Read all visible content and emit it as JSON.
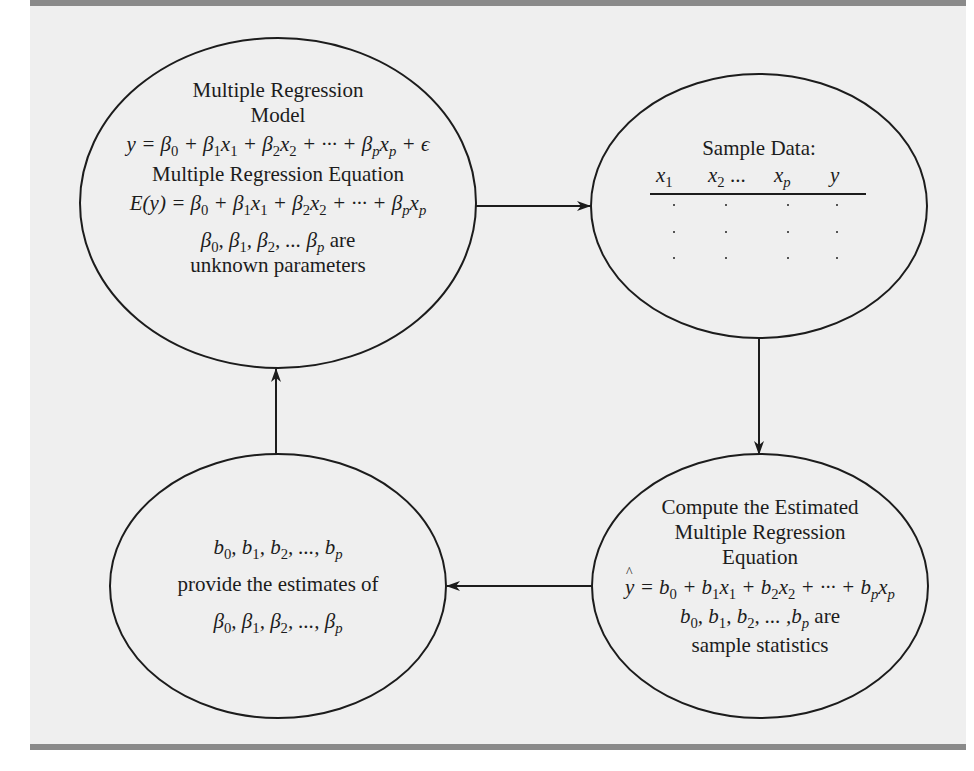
{
  "diagram": {
    "type": "flow-cycle",
    "colors": {
      "background": "#efefef",
      "rule": "#8a8a8a",
      "stroke": "#1c1c1c"
    },
    "nodes": {
      "model": {
        "title_line1": "Multiple Regression",
        "title_line2": "Model",
        "model_equation": "y = β0 + β1x1 + β2x2 + ··· + βpxp + ϵ",
        "subtitle": "Multiple Regression Equation",
        "expected_equation": "E(y) = β0 + β1x1 + β2x2 + ··· + βpxp",
        "params": "β0, β1, β2, ... βp are",
        "params_desc": "unknown parameters"
      },
      "sample": {
        "title": "Sample Data:",
        "columns": [
          "x1",
          "x2",
          "...",
          "xp",
          "y"
        ],
        "rows": 3
      },
      "compute": {
        "title_line1": "Compute the Estimated",
        "title_line2": "Multiple Regression",
        "title_line3": "Equation",
        "estimated_equation": "ŷ = b0 + b1x1 + b2x2 + ··· + bpxp",
        "stats": "b0, b1, b2, ..., bp are",
        "stats_desc": "sample statistics"
      },
      "estimates": {
        "stats": "b0, b1, b2, ..., bp",
        "desc": "provide the estimates of",
        "params": "β0, β1, β2, ..., βp"
      }
    },
    "edges": [
      {
        "from": "model",
        "to": "sample",
        "direction": "right"
      },
      {
        "from": "sample",
        "to": "compute",
        "direction": "down"
      },
      {
        "from": "compute",
        "to": "estimates",
        "direction": "left"
      },
      {
        "from": "estimates",
        "to": "model",
        "direction": "up"
      }
    ],
    "text": {
      "words_plus": "+",
      "eq": "=",
      "cdots": "···",
      "ellipsis": "...",
      "are": "are",
      "comma": ","
    }
  }
}
